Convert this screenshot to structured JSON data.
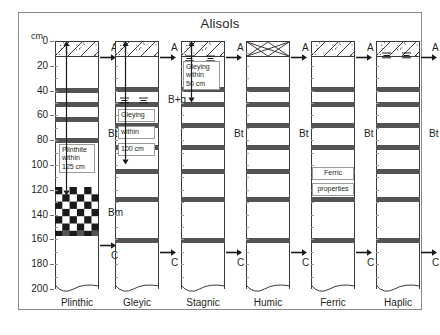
{
  "figure": {
    "title": "Alisols",
    "axis_unit": "cm",
    "axis_ticks": [
      "0",
      "20",
      "40",
      "60",
      "80",
      "100",
      "120",
      "140",
      "160",
      "180",
      "200"
    ],
    "axis_min": 0,
    "axis_max": 200
  },
  "horizon_labels": {
    "a": "A",
    "bt": "Bt",
    "bg": "B+g",
    "bm": "Bm",
    "c": "C"
  },
  "columns": [
    {
      "name": "Plinthic",
      "a_pattern": "stipple-diagonal",
      "b_label": "Bt",
      "lower_label": "Bm",
      "c_label": "C",
      "note_lines": [
        "Plinthite",
        "within",
        "125 cm"
      ]
    },
    {
      "name": "Gleyic",
      "a_pattern": "stipple-diagonal",
      "b_label": "B+g",
      "c_label": "C",
      "note_lines": [
        "Gleying",
        "within",
        "100 cm"
      ]
    },
    {
      "name": "Stagnic",
      "a_pattern": "stipple-diagonal",
      "b_label": "Bt",
      "c_label": "C",
      "note_lines": [
        "Gleying",
        "within",
        "50 cm"
      ]
    },
    {
      "name": "Humic",
      "a_pattern": "cross-hatch",
      "b_label": "Bt",
      "c_label": "C",
      "note_lines": []
    },
    {
      "name": "Ferric",
      "a_pattern": "stipple-diagonal",
      "b_label": "Bt",
      "c_label": "C",
      "note_lines": [
        "Ferric",
        "properties"
      ]
    },
    {
      "name": "Haplic",
      "a_pattern": "stipple-diagonal",
      "b_label": "Bt",
      "c_label": "C",
      "note_lines": []
    }
  ],
  "chart_data": {
    "type": "table",
    "title": "Alisols",
    "ylabel": "cm",
    "ylim": [
      0,
      200
    ],
    "yticks": [
      0,
      20,
      40,
      60,
      80,
      100,
      120,
      140,
      160,
      180,
      200
    ],
    "categories": [
      "Plinthic",
      "Gleyic",
      "Stagnic",
      "Humic",
      "Ferric",
      "Haplic"
    ],
    "series": [
      {
        "name": "Plinthic",
        "horizons": [
          {
            "label": "A",
            "top_cm": 0,
            "bottom_cm": 13,
            "pattern": "stipple-diagonal"
          },
          {
            "label": "Bt",
            "top_cm": 13,
            "bottom_cm": 118,
            "pattern": "banded"
          },
          {
            "label": "Bm",
            "top_cm": 118,
            "bottom_cm": 157,
            "pattern": "checkerboard"
          },
          {
            "label": "C",
            "top_cm": 157,
            "bottom_cm": 200,
            "pattern": "plain"
          }
        ],
        "bands_cm": [
          [
            38,
            42
          ],
          [
            49,
            53
          ],
          [
            61,
            65
          ],
          [
            78,
            82
          ],
          [
            153,
            157
          ]
        ],
        "annotation": "Plinthite within 125 cm",
        "annotation_depth_cm": 125
      },
      {
        "name": "Gleyic",
        "horizons": [
          {
            "label": "A",
            "top_cm": 0,
            "bottom_cm": 13,
            "pattern": "stipple-diagonal"
          },
          {
            "label": "B+g",
            "top_cm": 13,
            "bottom_cm": 163,
            "pattern": "banded"
          },
          {
            "label": "C",
            "top_cm": 163,
            "bottom_cm": 200,
            "pattern": "plain"
          }
        ],
        "bands_cm": [
          [
            37,
            41
          ],
          [
            49,
            53
          ],
          [
            66,
            70
          ],
          [
            84,
            88
          ],
          [
            103,
            107
          ],
          [
            126,
            130
          ],
          [
            159,
            163
          ]
        ],
        "annotation": "Gleying within 100 cm",
        "annotation_depth_cm": 100
      },
      {
        "name": "Stagnic",
        "horizons": [
          {
            "label": "A",
            "top_cm": 0,
            "bottom_cm": 13,
            "pattern": "stipple-diagonal"
          },
          {
            "label": "Bt",
            "top_cm": 13,
            "bottom_cm": 163,
            "pattern": "banded"
          },
          {
            "label": "C",
            "top_cm": 163,
            "bottom_cm": 200,
            "pattern": "plain"
          }
        ],
        "bands_cm": [
          [
            37,
            41
          ],
          [
            49,
            53
          ],
          [
            66,
            70
          ],
          [
            84,
            88
          ],
          [
            103,
            107
          ],
          [
            126,
            130
          ],
          [
            159,
            163
          ]
        ],
        "annotation": "Gleying within 50 cm",
        "annotation_depth_cm": 50
      },
      {
        "name": "Humic",
        "horizons": [
          {
            "label": "A",
            "top_cm": 0,
            "bottom_cm": 13,
            "pattern": "cross-hatch"
          },
          {
            "label": "Bt",
            "top_cm": 13,
            "bottom_cm": 163,
            "pattern": "banded"
          },
          {
            "label": "C",
            "top_cm": 163,
            "bottom_cm": 200,
            "pattern": "plain"
          }
        ],
        "bands_cm": [
          [
            37,
            41
          ],
          [
            49,
            53
          ],
          [
            66,
            70
          ],
          [
            84,
            88
          ],
          [
            103,
            107
          ],
          [
            126,
            130
          ],
          [
            159,
            163
          ]
        ],
        "annotation": null,
        "annotation_depth_cm": null
      },
      {
        "name": "Ferric",
        "horizons": [
          {
            "label": "A",
            "top_cm": 0,
            "bottom_cm": 13,
            "pattern": "stipple-diagonal"
          },
          {
            "label": "Bt",
            "top_cm": 13,
            "bottom_cm": 163,
            "pattern": "banded"
          },
          {
            "label": "C",
            "top_cm": 163,
            "bottom_cm": 200,
            "pattern": "plain"
          }
        ],
        "bands_cm": [
          [
            37,
            41
          ],
          [
            49,
            53
          ],
          [
            66,
            70
          ],
          [
            84,
            88
          ],
          [
            103,
            107
          ],
          [
            126,
            130
          ],
          [
            159,
            163
          ]
        ],
        "annotation": "Ferric properties",
        "annotation_depth_cm": 110
      },
      {
        "name": "Haplic",
        "horizons": [
          {
            "label": "A",
            "top_cm": 0,
            "bottom_cm": 13,
            "pattern": "stipple-diagonal"
          },
          {
            "label": "Bt",
            "top_cm": 13,
            "bottom_cm": 163,
            "pattern": "banded"
          },
          {
            "label": "C",
            "top_cm": 163,
            "bottom_cm": 200,
            "pattern": "plain"
          }
        ],
        "bands_cm": [
          [
            37,
            41
          ],
          [
            49,
            53
          ],
          [
            66,
            70
          ],
          [
            84,
            88
          ],
          [
            103,
            107
          ],
          [
            126,
            130
          ],
          [
            159,
            163
          ]
        ],
        "annotation": null,
        "annotation_depth_cm": null
      }
    ]
  }
}
